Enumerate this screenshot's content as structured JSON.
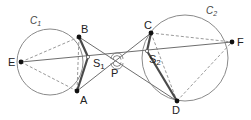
{
  "diagram": {
    "circles": [
      {
        "id": "C1",
        "label": "C",
        "subscript": "1",
        "cx": 50,
        "cy": 62,
        "r": 33
      },
      {
        "id": "C2",
        "label": "C",
        "subscript": "2",
        "cx": 185,
        "cy": 58,
        "r": 43
      }
    ],
    "points": {
      "E": {
        "label": "E",
        "x": 21,
        "y": 62
      },
      "B": {
        "label": "B",
        "x": 79,
        "y": 37
      },
      "A": {
        "label": "A",
        "x": 77,
        "y": 91
      },
      "C": {
        "label": "C",
        "x": 151,
        "y": 33
      },
      "D": {
        "label": "D",
        "x": 177,
        "y": 101
      },
      "F": {
        "label": "F",
        "x": 232,
        "y": 42
      },
      "S1": {
        "label": "S",
        "subscript": "1",
        "x": 88,
        "y": 57
      },
      "S2": {
        "label": "S",
        "subscript": "2",
        "x": 147,
        "y": 51
      },
      "P": {
        "label": "P",
        "x": 117,
        "y": 61
      }
    },
    "solid_lines": [
      [
        "E",
        "F"
      ],
      [
        "B",
        "D"
      ],
      [
        "A",
        "C"
      ]
    ],
    "thick_segments": [
      [
        "B",
        "S1"
      ],
      [
        "A",
        "S1"
      ],
      [
        "C",
        "S2"
      ],
      [
        "D",
        "S2"
      ]
    ],
    "dashed_lines": [
      [
        "E",
        "B"
      ],
      [
        "E",
        "A"
      ],
      [
        "B",
        "A"
      ],
      [
        "C",
        "F"
      ],
      [
        "D",
        "F"
      ],
      [
        "C",
        "D"
      ]
    ],
    "angle_marker_at": "P",
    "colors": {
      "stroke": "#6e6e6e",
      "thick": "#4a4a4a",
      "dashed": "#9a9a9a",
      "point": "#111111",
      "background": "#ffffff"
    }
  }
}
